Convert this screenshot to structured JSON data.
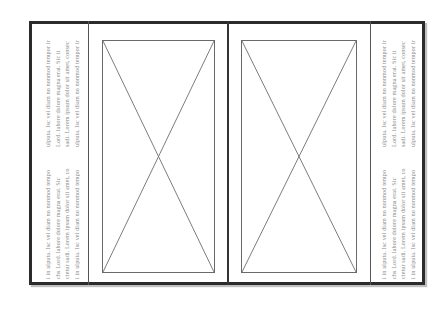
{
  "document": {
    "layout": "tri-fold brochure spread (rotated text columns, two image placeholders)",
    "left_panel": {
      "top_block": [
        "ulputa. Isc vel diam no nonmod tempor ir",
        "Lord. labore dolore magna erat. Sic it",
        "sadi. Lorem ipsum dolor sit amet, consec",
        "ulputa. Isc vel diam no nonmod tempor ir"
      ],
      "bottom_block": [
        "i in ulputa. Isc vel diam no nonmod tempo",
        "chs Lord. labore dolore magna erat. Sic",
        "ctetur sadi. Lorem ipsum dolor sit amet, co",
        "i in ulputa. Isc vel diam no nonmod tempo"
      ]
    },
    "center_left_panel": {
      "image_placeholder": "image-placeholder"
    },
    "center_right_panel": {
      "image_placeholder": "image-placeholder"
    },
    "right_panel": {
      "top_block": [
        "ulputa. Isc vel diam no nonmod tempor ir",
        "Lord. labore dolore magna erat. Sic it",
        "sadi. Lorem ipsum dolor sit amet, consec",
        "ulputa. Isc vel diam no nonmod tempor ir"
      ],
      "bottom_block": [
        "i in ulputa. Isc vel diam no nonmod tempo",
        "chs Lord. labore dolore magna erat. Sic",
        "ctetur sadi. Lorem ipsum dolor sit amet, co",
        "i in ulputa. Isc vel diam no nonmod tempo"
      ]
    },
    "colors": {
      "frame": "#2b2b2b",
      "divider": "#555555",
      "placeholder_stroke": "#6a6a6a",
      "text": "#8a8a8a"
    }
  }
}
